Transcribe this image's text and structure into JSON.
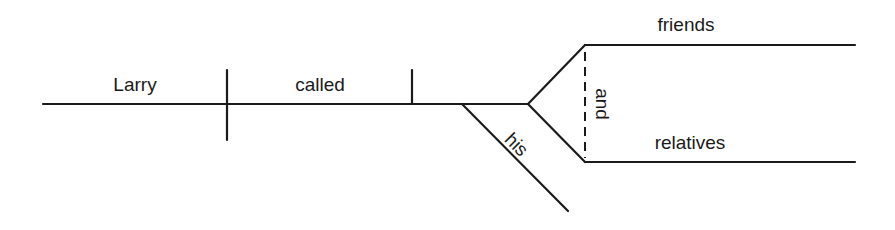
{
  "diagram": {
    "type": "sentence-diagram",
    "sentence": "Larry called his friends and relatives",
    "subject": "Larry",
    "verb": "called",
    "modifier": "his",
    "conjunction": "and",
    "objects": [
      "friends",
      "relatives"
    ],
    "line_color": "#1a1a1a",
    "background": "#ffffff"
  }
}
